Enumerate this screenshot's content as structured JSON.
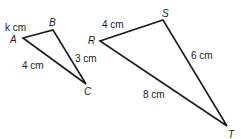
{
  "diagram": {
    "type": "similar-triangles",
    "triangles": [
      {
        "name": "triangle-ABC",
        "vertices": {
          "A": {
            "label": "A",
            "x": 23,
            "y": 38,
            "lx": 10,
            "ly": 43
          },
          "B": {
            "label": "B",
            "x": 53,
            "y": 30,
            "lx": 49,
            "ly": 26
          },
          "C": {
            "label": "C",
            "x": 86,
            "y": 84,
            "lx": 84,
            "ly": 94
          }
        },
        "sides": [
          {
            "from": "A",
            "to": "B",
            "label": "k cm",
            "lx": 5,
            "ly": 31
          },
          {
            "from": "B",
            "to": "C",
            "label": "3 cm",
            "lx": 75,
            "ly": 60
          },
          {
            "from": "A",
            "to": "C",
            "label": "4 cm",
            "lx": 22,
            "ly": 68
          }
        ]
      },
      {
        "name": "triangle-RST",
        "vertices": {
          "R": {
            "label": "R",
            "x": 100,
            "y": 41,
            "lx": 88,
            "ly": 43
          },
          "S": {
            "label": "S",
            "x": 163,
            "y": 20,
            "lx": 162,
            "ly": 16
          },
          "T": {
            "label": "T",
            "x": 227,
            "y": 126,
            "lx": 227,
            "ly": 137
          }
        },
        "sides": [
          {
            "from": "R",
            "to": "S",
            "label": "4 cm",
            "lx": 102,
            "ly": 28
          },
          {
            "from": "S",
            "to": "T",
            "label": "6 cm",
            "lx": 191,
            "ly": 58
          },
          {
            "from": "R",
            "to": "T",
            "label": "8 cm",
            "lx": 143,
            "ly": 97
          }
        ]
      }
    ]
  },
  "labels": {
    "A": "A",
    "B": "B",
    "C": "C",
    "R": "R",
    "S": "S",
    "T": "T",
    "AB": "k cm",
    "BC": "3 cm",
    "AC": "4 cm",
    "RS": "4 cm",
    "ST": "6 cm",
    "RT": "8 cm"
  }
}
